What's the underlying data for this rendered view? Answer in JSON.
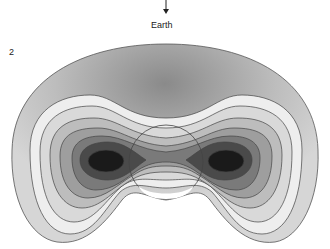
{
  "figure": {
    "number_label": "2",
    "direction_label": "Earth",
    "direction_arrow": "arrow-down-icon",
    "contour_levels": 7,
    "colors": {
      "outline": "#444444",
      "lightest": "#f2f2f2",
      "darkest": "#111111"
    }
  }
}
